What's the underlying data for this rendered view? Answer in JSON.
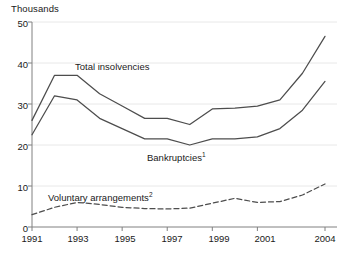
{
  "chart_data": {
    "type": "line",
    "title": "",
    "subtitle": "",
    "unit_label": "Thousands",
    "xlabel": "",
    "ylabel": "",
    "ylim": [
      0,
      50
    ],
    "xlim": [
      1991,
      2004
    ],
    "grid": true,
    "grid_axis": "y",
    "legend_position": "inline-annotations",
    "y_ticks": [
      0,
      10,
      20,
      30,
      40,
      50
    ],
    "y_tick_labels": [
      "0",
      "10",
      "20",
      "30",
      "40",
      "50"
    ],
    "x_ticks": [
      1991,
      1993,
      1995,
      1997,
      1999,
      2001,
      2004
    ],
    "x_tick_labels": [
      "1991",
      "1993",
      "1995",
      "1997",
      "1999",
      "2001",
      "2004"
    ],
    "x": [
      1991,
      1992,
      1993,
      1994,
      1995,
      1996,
      1997,
      1998,
      1999,
      2000,
      2001,
      2002,
      2003,
      2004
    ],
    "series": [
      {
        "name": "Total insolvencies",
        "label_html": "Total insolvencies",
        "style": "solid",
        "color": "#4d4d4d",
        "values": [
          26.0,
          37.0,
          37.0,
          32.5,
          29.5,
          26.5,
          26.5,
          25.0,
          28.8,
          29.0,
          29.5,
          31.0,
          37.5,
          46.5
        ]
      },
      {
        "name": "Bankruptcies",
        "label_html": "Bankruptcies",
        "footnote_marker": "1",
        "style": "solid",
        "color": "#4d4d4d",
        "values": [
          22.5,
          32.0,
          31.0,
          26.5,
          24.0,
          21.5,
          21.5,
          20.0,
          21.5,
          21.5,
          22.0,
          24.0,
          28.5,
          35.5
        ]
      },
      {
        "name": "Voluntary arrangements",
        "label_html": "Voluntary arrangements",
        "footnote_marker": "2",
        "style": "dashed",
        "color": "#4d4d4d",
        "values": [
          3.0,
          4.8,
          6.0,
          5.5,
          4.8,
          4.5,
          4.4,
          4.6,
          5.8,
          7.0,
          6.0,
          6.2,
          7.8,
          10.5
        ]
      }
    ],
    "annotations": [
      {
        "id": "total-insolvencies-label",
        "text": "Total insolvencies",
        "x_px": 75,
        "y_px": 67
      },
      {
        "id": "bankruptcies-label",
        "text": "Bankruptcies",
        "sup": "1",
        "x_px": 147,
        "y_px": 158
      },
      {
        "id": "voluntary-arrangements-label",
        "text": "Voluntary arrangements",
        "sup": "2",
        "x_px": 48,
        "y_px": 198
      }
    ],
    "colors": {
      "line": "#4d4d4d",
      "axis": "#808080",
      "grid": "#e8e8e8",
      "text": "#1a1a1a",
      "background": "#ffffff"
    }
  }
}
